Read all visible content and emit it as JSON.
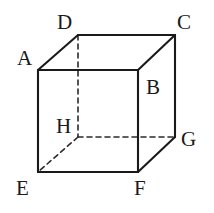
{
  "figure": {
    "name": "cube-diagram",
    "type": "geometric-solid",
    "solid": "cube",
    "projection": "oblique",
    "background_color": "#ffffff",
    "stroke_color": "#1a1a1a",
    "hidden_stroke_color": "#2b2b2b",
    "visible_stroke_width": 2.1,
    "hidden_stroke_width": 1.6,
    "hidden_dash_pattern": "5 4"
  },
  "vertices": [
    {
      "id": "A",
      "label": "A",
      "x": 38,
      "y": 70,
      "hidden": false,
      "label_x": 17,
      "label_y": 48
    },
    {
      "id": "B",
      "label": "B",
      "x": 138,
      "y": 70,
      "hidden": false,
      "label_x": 146,
      "label_y": 77
    },
    {
      "id": "C",
      "label": "C",
      "x": 175,
      "y": 35,
      "hidden": false,
      "label_x": 177,
      "label_y": 12
    },
    {
      "id": "D",
      "label": "D",
      "x": 78,
      "y": 35,
      "hidden": false,
      "label_x": 57,
      "label_y": 12
    },
    {
      "id": "E",
      "label": "E",
      "x": 38,
      "y": 172,
      "hidden": false,
      "label_x": 16,
      "label_y": 178
    },
    {
      "id": "F",
      "label": "F",
      "x": 138,
      "y": 172,
      "hidden": false,
      "label_x": 134,
      "label_y": 178
    },
    {
      "id": "G",
      "label": "G",
      "x": 175,
      "y": 137,
      "hidden": false,
      "label_x": 181,
      "label_y": 129
    },
    {
      "id": "H",
      "label": "H",
      "x": 78,
      "y": 137,
      "hidden": true,
      "label_x": 56,
      "label_y": 116
    }
  ],
  "edges": [
    {
      "from": "A",
      "to": "B",
      "hidden": false,
      "name": "edge-ab"
    },
    {
      "from": "B",
      "to": "F",
      "hidden": false,
      "name": "edge-bf"
    },
    {
      "from": "F",
      "to": "E",
      "hidden": false,
      "name": "edge-fe"
    },
    {
      "from": "E",
      "to": "A",
      "hidden": false,
      "name": "edge-ea"
    },
    {
      "from": "D",
      "to": "C",
      "hidden": false,
      "name": "edge-dc"
    },
    {
      "from": "C",
      "to": "G",
      "hidden": false,
      "name": "edge-cg"
    },
    {
      "from": "A",
      "to": "D",
      "hidden": false,
      "name": "edge-ad"
    },
    {
      "from": "B",
      "to": "C",
      "hidden": false,
      "name": "edge-bc"
    },
    {
      "from": "F",
      "to": "G",
      "hidden": false,
      "name": "edge-fg"
    },
    {
      "from": "D",
      "to": "H",
      "hidden": true,
      "name": "edge-dh"
    },
    {
      "from": "H",
      "to": "G",
      "hidden": true,
      "name": "edge-hg"
    },
    {
      "from": "H",
      "to": "E",
      "hidden": true,
      "name": "edge-he"
    }
  ]
}
